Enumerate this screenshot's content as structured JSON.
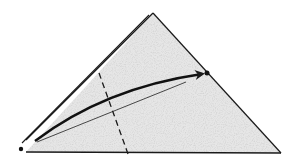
{
  "diagram": {
    "type": "origami-fold-step",
    "colors": {
      "paper_fill": "#e4e4e4",
      "paper_speckle": "#c8c8c8",
      "line": "#1a1a1a",
      "background": "#ffffff"
    },
    "triangle": {
      "apex": [
        153,
        13
      ],
      "left": [
        26,
        152
      ],
      "right": [
        281,
        153
      ]
    },
    "layer_edge": {
      "from": [
        21,
        143
      ],
      "to": [
        148,
        14
      ]
    },
    "points": [
      {
        "name": "start-point",
        "x": 21,
        "y": 149
      },
      {
        "name": "target-point",
        "x": 207,
        "y": 73
      }
    ],
    "fold_line": {
      "style": "dashed",
      "from": [
        99,
        73
      ],
      "to": [
        128,
        154
      ]
    },
    "reference_line": {
      "from": [
        37,
        142
      ],
      "to": [
        186,
        82
      ]
    },
    "arrow": {
      "from": [
        35,
        141
      ],
      "control": [
        110,
        90
      ],
      "to": [
        202,
        73
      ]
    }
  }
}
